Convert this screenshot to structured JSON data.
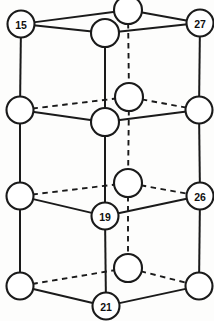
{
  "figure": {
    "type": "lattice-diagram",
    "width": 214,
    "height": 321,
    "background_color": "#fdfdfc",
    "line_color": "#1a1a1a",
    "node_fill_color": "#ffffff",
    "projection": "oblique",
    "layers": 4,
    "solid_edge_meaning": "visible front edge",
    "dashed_edge_meaning": "hidden rear edge"
  },
  "chart_data": {
    "type": "scatter",
    "xlabel": "",
    "ylabel": "",
    "xlim": [
      0,
      214
    ],
    "ylim": [
      321,
      0
    ],
    "grid": false,
    "legend": null,
    "nodes": [
      {
        "id": "n-top-back",
        "label": "",
        "x": 128,
        "y": 10,
        "r": 14.0,
        "layer": 1,
        "position": "back-center"
      },
      {
        "id": "n-top-left",
        "label": "15",
        "x": 21,
        "y": 24,
        "r": 13.5,
        "layer": 1,
        "position": "front-left"
      },
      {
        "id": "n-top-right",
        "label": "27",
        "x": 200,
        "y": 23,
        "r": 13.5,
        "layer": 1,
        "position": "front-right"
      },
      {
        "id": "n-top-center",
        "label": "",
        "x": 105,
        "y": 33,
        "r": 14.0,
        "layer": 1,
        "position": "front-center"
      },
      {
        "id": "n-l2-back",
        "label": "",
        "x": 129,
        "y": 97,
        "r": 14.0,
        "layer": 2,
        "position": "back-center"
      },
      {
        "id": "n-l2-left",
        "label": "",
        "x": 20,
        "y": 110,
        "r": 13.5,
        "layer": 2,
        "position": "front-left"
      },
      {
        "id": "n-l2-right",
        "label": "",
        "x": 199,
        "y": 110,
        "r": 13.5,
        "layer": 2,
        "position": "front-right"
      },
      {
        "id": "n-l2-center",
        "label": "",
        "x": 105,
        "y": 122,
        "r": 14.0,
        "layer": 2,
        "position": "front-center"
      },
      {
        "id": "n-l3-back",
        "label": "",
        "x": 128,
        "y": 183,
        "r": 14.0,
        "layer": 3,
        "position": "back-center"
      },
      {
        "id": "n-l3-left",
        "label": "",
        "x": 20,
        "y": 196,
        "r": 13.5,
        "layer": 3,
        "position": "front-left"
      },
      {
        "id": "n-l3-right",
        "label": "26",
        "x": 200,
        "y": 196,
        "r": 13.5,
        "layer": 3,
        "position": "front-right"
      },
      {
        "id": "n-l3-center",
        "label": "19",
        "x": 105,
        "y": 216,
        "r": 13.5,
        "layer": 3,
        "position": "front-center"
      },
      {
        "id": "n-l4-back",
        "label": "",
        "x": 128,
        "y": 268,
        "r": 14.0,
        "layer": 4,
        "position": "back-center"
      },
      {
        "id": "n-l4-left",
        "label": "",
        "x": 20,
        "y": 286,
        "r": 13.5,
        "layer": 4,
        "position": "front-left"
      },
      {
        "id": "n-l4-right",
        "label": "",
        "x": 199,
        "y": 286,
        "r": 13.5,
        "layer": 4,
        "position": "front-right"
      },
      {
        "id": "n-l4-center",
        "label": "21",
        "x": 106,
        "y": 306,
        "r": 13.5,
        "layer": 4,
        "position": "front-center"
      }
    ],
    "labeled_values": [
      15,
      27,
      19,
      26,
      21
    ],
    "edges_solid": [
      {
        "from": "n-top-left",
        "to": "n-top-back"
      },
      {
        "from": "n-top-back",
        "to": "n-top-right"
      },
      {
        "from": "n-top-left",
        "to": "n-top-center"
      },
      {
        "from": "n-top-center",
        "to": "n-top-right"
      },
      {
        "from": "n-l2-left",
        "to": "n-l2-center"
      },
      {
        "from": "n-l2-center",
        "to": "n-l2-right"
      },
      {
        "from": "n-l3-left",
        "to": "n-l3-center"
      },
      {
        "from": "n-l3-center",
        "to": "n-l3-right"
      },
      {
        "from": "n-l4-left",
        "to": "n-l4-center"
      },
      {
        "from": "n-l4-center",
        "to": "n-l4-right"
      },
      {
        "from": "n-top-left",
        "to": "n-l2-left"
      },
      {
        "from": "n-l2-left",
        "to": "n-l3-left"
      },
      {
        "from": "n-l3-left",
        "to": "n-l4-left"
      },
      {
        "from": "n-top-right",
        "to": "n-l2-right"
      },
      {
        "from": "n-l2-right",
        "to": "n-l3-right"
      },
      {
        "from": "n-l3-right",
        "to": "n-l4-right"
      },
      {
        "from": "n-top-center",
        "to": "n-l2-center"
      },
      {
        "from": "n-l2-center",
        "to": "n-l3-center"
      },
      {
        "from": "n-l3-center",
        "to": "n-l4-center"
      }
    ],
    "edges_dashed": [
      {
        "from": "n-l2-left",
        "to": "n-l2-back"
      },
      {
        "from": "n-l2-back",
        "to": "n-l2-right"
      },
      {
        "from": "n-l3-left",
        "to": "n-l3-back"
      },
      {
        "from": "n-l3-back",
        "to": "n-l3-right"
      },
      {
        "from": "n-l4-left",
        "to": "n-l4-back"
      },
      {
        "from": "n-l4-back",
        "to": "n-l4-right"
      },
      {
        "from": "n-top-back",
        "to": "n-l2-back"
      },
      {
        "from": "n-l2-back",
        "to": "n-l3-back"
      },
      {
        "from": "n-l3-back",
        "to": "n-l4-back"
      }
    ]
  }
}
